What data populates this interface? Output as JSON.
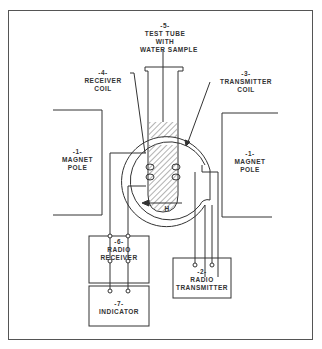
{
  "diagram": {
    "components": [
      {
        "id": "magnet-left",
        "number": "-1-",
        "lines": [
          "MAGNET",
          "POLE"
        ]
      },
      {
        "id": "magnet-right",
        "number": "-1-",
        "lines": [
          "MAGNET",
          "POLE"
        ]
      },
      {
        "id": "transmitter",
        "number": "-2-",
        "lines": [
          "RADIO",
          "TRANSMITTER"
        ]
      },
      {
        "id": "transmitter-coil",
        "number": "-3-",
        "lines": [
          "TRANSMITTER",
          "COIL"
        ]
      },
      {
        "id": "receiver-coil",
        "number": "-4-",
        "lines": [
          "RECEIVER",
          "COIL"
        ]
      },
      {
        "id": "test-tube",
        "number": "-5-",
        "lines": [
          "TEST TUBE",
          "WITH",
          "WATER SAMPLE"
        ]
      },
      {
        "id": "receiver",
        "number": "-6-",
        "lines": [
          "RADIO",
          "RECEIVER"
        ]
      },
      {
        "id": "indicator",
        "number": "-7-",
        "lines": [
          "INDICATOR"
        ]
      }
    ],
    "field_label": "H",
    "colors": {
      "line": "#333333",
      "background": "#ffffff"
    }
  }
}
